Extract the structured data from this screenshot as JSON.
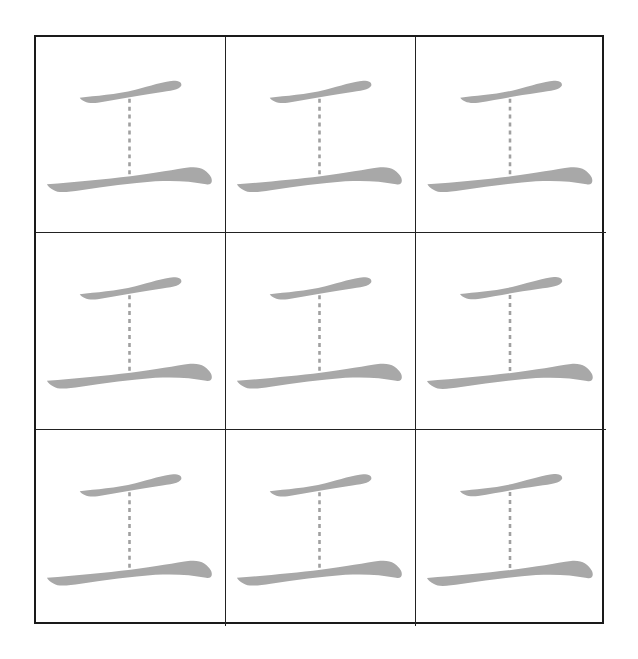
{
  "worksheet": {
    "character": "工",
    "rows": 3,
    "columns": 3,
    "stroke_color": "#a8a8a8",
    "guide_color": "#a0a0a0",
    "border_color": "#1a1a1a",
    "cells": [
      {
        "character": "工",
        "strokes_shown": [
          "horizontal-top",
          "horizontal-bottom"
        ],
        "guide": "vertical-dashed"
      },
      {
        "character": "工",
        "strokes_shown": [
          "horizontal-top",
          "horizontal-bottom"
        ],
        "guide": "vertical-dashed"
      },
      {
        "character": "工",
        "strokes_shown": [
          "horizontal-top",
          "horizontal-bottom"
        ],
        "guide": "vertical-dashed"
      },
      {
        "character": "工",
        "strokes_shown": [
          "horizontal-top",
          "horizontal-bottom"
        ],
        "guide": "vertical-dashed"
      },
      {
        "character": "工",
        "strokes_shown": [
          "horizontal-top",
          "horizontal-bottom"
        ],
        "guide": "vertical-dashed"
      },
      {
        "character": "工",
        "strokes_shown": [
          "horizontal-top",
          "horizontal-bottom"
        ],
        "guide": "vertical-dashed"
      },
      {
        "character": "工",
        "strokes_shown": [
          "horizontal-top",
          "horizontal-bottom"
        ],
        "guide": "vertical-dashed"
      },
      {
        "character": "工",
        "strokes_shown": [
          "horizontal-top",
          "horizontal-bottom"
        ],
        "guide": "vertical-dashed"
      },
      {
        "character": "工",
        "strokes_shown": [
          "horizontal-top",
          "horizontal-bottom"
        ],
        "guide": "vertical-dashed"
      }
    ]
  }
}
